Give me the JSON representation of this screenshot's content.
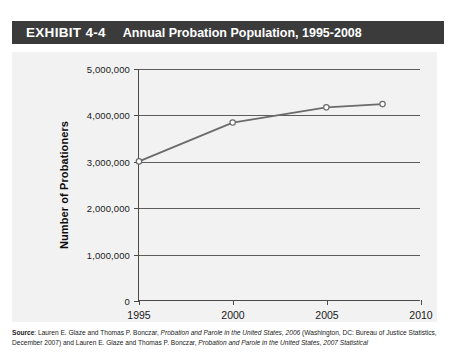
{
  "exhibit": {
    "label": "EXHIBIT 4-4",
    "title": "Annual Probation Population, 1995-2008"
  },
  "chart_data": {
    "type": "line",
    "title": "Annual Probation Population, 1995-2008",
    "xlabel": "",
    "ylabel": "Number of Probationers",
    "x": [
      1995,
      2000,
      2005,
      2008
    ],
    "values": [
      3000000,
      3840000,
      4170000,
      4240000
    ],
    "series": [
      {
        "name": "Number of Probationers",
        "values": [
          3000000,
          3840000,
          4170000,
          4240000
        ]
      }
    ],
    "xlim": [
      1995,
      2010
    ],
    "ylim": [
      0,
      5000000
    ],
    "xticks": [
      1995,
      2000,
      2005,
      2010
    ],
    "xticklabels": [
      "1995",
      "2000",
      "2005",
      "2010"
    ],
    "yticks": [
      0,
      1000000,
      2000000,
      3000000,
      4000000,
      5000000
    ],
    "yticklabels": [
      "0",
      "1,000,000",
      "2,000,000",
      "3,000,000",
      "4,000,000",
      "5,000,000"
    ],
    "grid": "horizontal",
    "legend": "none",
    "line_color": "#6b6b6b",
    "marker": "open-circle"
  },
  "source": {
    "prefix": "Source",
    "text_1": ": Lauren E. Glaze and Thomas P. Bonczar, ",
    "italic_1": "Probation and Parole in the United States, 2006",
    "text_2": " (Washington, DC: Bureau of Justice Statistics, December 2007) and Lauren E. Glaze and Thomas P. Bonczar, ",
    "italic_2": "Probation and Parole in the United States, 2007 Statistical"
  },
  "colors": {
    "header_bg": "#3b3b3b",
    "panel_bg": "#f2f2f2",
    "axis": "#4a4a4a",
    "line": "#6b6b6b"
  }
}
